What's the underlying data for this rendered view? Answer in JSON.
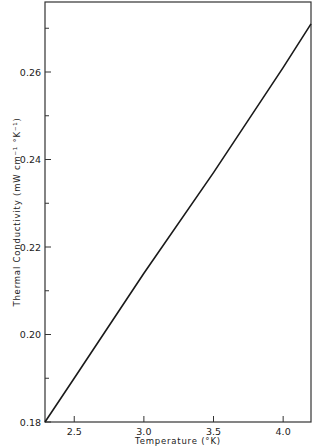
{
  "chart_data": {
    "type": "line",
    "title": "",
    "xlabel": "Temperature (°K)",
    "ylabel": "Thermal Conductivity (mW cm⁻¹ °K⁻¹)",
    "xlim": [
      2.29,
      4.2
    ],
    "ylim": [
      0.18,
      0.276
    ],
    "grid": false,
    "legend": null,
    "x_ticks": [
      2.5,
      3.0,
      3.5,
      4.0
    ],
    "x_tick_labels": [
      "2.5",
      "3.0",
      "3.5",
      "4.0"
    ],
    "y_ticks": [
      0.18,
      0.2,
      0.22,
      0.24,
      0.26
    ],
    "y_tick_labels": [
      "0.18",
      "0.20",
      "0.22",
      "0.24",
      "0.26"
    ],
    "y_minor_ticks": [
      0.19,
      0.21,
      0.23,
      0.25,
      0.27
    ],
    "series": [
      {
        "name": "thermal conductivity",
        "x": [
          2.29,
          2.5,
          3.0,
          3.5,
          4.0,
          4.2
        ],
        "values": [
          0.18,
          0.19,
          0.214,
          0.237,
          0.261,
          0.271
        ]
      }
    ]
  }
}
